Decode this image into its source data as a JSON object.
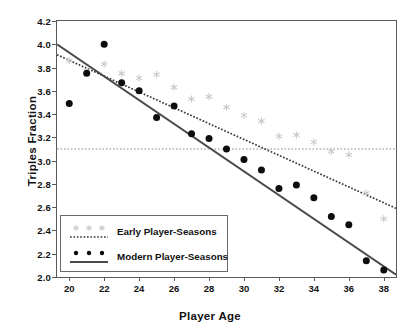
{
  "chart_data": {
    "type": "scatter",
    "title": "",
    "xlabel": "Player Age",
    "ylabel": "Triples  Fraction",
    "xlim": [
      19.3,
      38.7
    ],
    "ylim": [
      2.0,
      4.2
    ],
    "xticks": [
      20,
      22,
      24,
      26,
      28,
      30,
      32,
      34,
      36,
      38
    ],
    "xticklabels": [
      "20",
      "22",
      "24",
      "26",
      "28",
      "30",
      "32",
      "34",
      "36",
      "38"
    ],
    "yticks": [
      2.0,
      2.2,
      2.4,
      2.6,
      2.8,
      3.0,
      3.2,
      3.4,
      3.6,
      3.8,
      4.0,
      4.2
    ],
    "yticklabels": [
      "2.0",
      "2.2",
      "2.4",
      "2.6",
      "2.8",
      "3.0",
      "3.2",
      "3.4",
      "3.6",
      "3.8",
      "4.0",
      "4.2"
    ],
    "grid": false,
    "legend_position": "lower-left",
    "reference_lines": [
      {
        "name": "overall-mean-line",
        "orientation": "horizontal",
        "y": 3.1,
        "style": "dotted",
        "color": "#8c8c8c"
      }
    ],
    "series": [
      {
        "name": "Early Player-Seasons",
        "marker": "star",
        "color": "#c8c8c8",
        "x": [
          20,
          21,
          22,
          23,
          24,
          25,
          26,
          27,
          28,
          29,
          30,
          31,
          32,
          33,
          34,
          35,
          36,
          37,
          38
        ],
        "y": [
          3.86,
          3.77,
          3.83,
          3.75,
          3.71,
          3.74,
          3.63,
          3.53,
          3.55,
          3.46,
          3.39,
          3.34,
          3.21,
          3.22,
          3.16,
          3.08,
          3.05,
          2.72,
          2.5
        ],
        "fit": {
          "name": "early-fit-line",
          "style": "dotted",
          "color": "#3a3a3a",
          "x0": 19.3,
          "y0": 3.91,
          "x1": 38.7,
          "y1": 2.59
        }
      },
      {
        "name": "Modern Player-Seasons",
        "marker": "circle",
        "color": "#0d0d0d",
        "x": [
          20,
          21,
          22,
          23,
          24,
          25,
          26,
          27,
          28,
          29,
          30,
          31,
          32,
          33,
          34,
          35,
          36,
          37,
          38
        ],
        "y": [
          3.49,
          3.75,
          4.0,
          3.67,
          3.6,
          3.37,
          3.47,
          3.23,
          3.19,
          3.1,
          3.01,
          2.92,
          2.76,
          2.79,
          2.68,
          2.52,
          2.45,
          2.14,
          2.06
        ],
        "fit": {
          "name": "modern-fit-line",
          "style": "solid",
          "color": "#4a4a4a",
          "x0": 19.3,
          "y0": 4.0,
          "x1": 38.7,
          "y1": 2.02
        }
      }
    ],
    "legend": [
      {
        "label": "Early Player-Seasons",
        "marker": "star",
        "marker_color": "#c8c8c8",
        "line_style": "dotted",
        "line_color": "#3a3a3a"
      },
      {
        "label": "Modern Player-Seasons",
        "marker": "circle",
        "marker_color": "#0d0d0d",
        "line_style": "solid",
        "line_color": "#4a4a4a"
      }
    ]
  }
}
